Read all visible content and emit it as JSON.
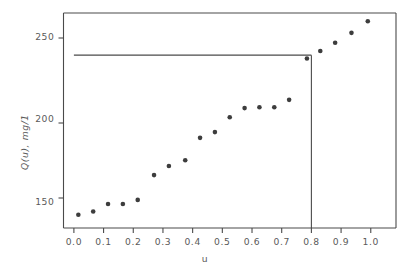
{
  "chart_data": {
    "type": "scatter",
    "title": "",
    "xlabel": "u",
    "ylabel": "Q(u), mg/1",
    "xlim": [
      -0.035,
      1.085
    ],
    "ylim": [
      134,
      264
    ],
    "grid": false,
    "legend": null,
    "xticks": [
      "0.0",
      "0.1",
      "0.2",
      "0.3",
      "0.4",
      "0.5",
      "0.6",
      "0.7",
      "0.8",
      "0.9",
      "1.0"
    ],
    "xtick_values": [
      0.0,
      0.1,
      0.2,
      0.3,
      0.4,
      0.5,
      0.6,
      0.7,
      0.8,
      0.9,
      1.0
    ],
    "yticks": [
      "150",
      "200",
      "250"
    ],
    "ytick_values": [
      150,
      200,
      250
    ],
    "x": [
      0.015,
      0.065,
      0.115,
      0.165,
      0.215,
      0.27,
      0.32,
      0.375,
      0.425,
      0.475,
      0.525,
      0.575,
      0.625,
      0.675,
      0.725,
      0.785,
      0.83,
      0.88,
      0.935,
      0.99
    ],
    "values": [
      142.0,
      144.0,
      148.5,
      148.5,
      151.0,
      166.0,
      171.5,
      175.0,
      188.5,
      192.0,
      201.0,
      206.5,
      207.0,
      207.0,
      211.5,
      236.5,
      241.0,
      246.0,
      252.0,
      259.0
    ],
    "annotations": [
      {
        "name": "threshold-horizontal-line",
        "type": "hline",
        "y": 238.5,
        "x_from": 0.0,
        "x_to": 0.8
      },
      {
        "name": "threshold-vertical-line",
        "type": "vline",
        "x": 0.8,
        "y_from": 134.0,
        "y_to": 238.5
      }
    ],
    "marker": "filled-circle",
    "marker_color": "#3d3d3d",
    "axis_color": "#4a4a4a",
    "text_color": "#5a5a5a",
    "background": "#ffffff"
  }
}
